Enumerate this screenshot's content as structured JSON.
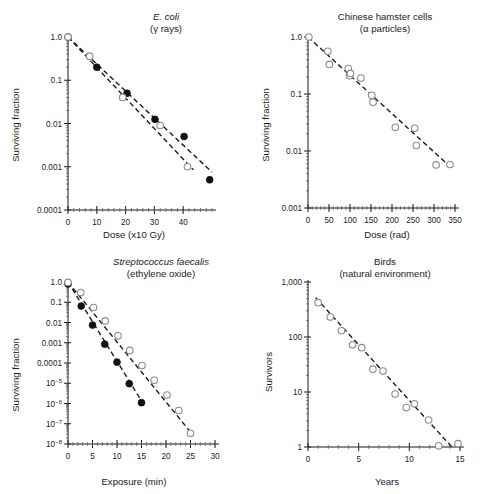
{
  "figure": {
    "panel_count": 4
  },
  "chart_data": [
    {
      "id": "ecoli",
      "type": "scatter",
      "title": "E. coli",
      "title_line1": "E. coli",
      "title_line2": "(γ rays)",
      "xlabel": "Dose (x10 Gy)",
      "ylabel": "Surviving fraction",
      "yscale": "log",
      "xlim": [
        0,
        50
      ],
      "ylim": [
        0.0001,
        1.0
      ],
      "xticks": [
        0,
        10,
        20,
        30,
        40
      ],
      "xticklabels": [
        "0",
        "10",
        "20",
        "30",
        "40"
      ],
      "yticks": [
        1.0,
        0.1,
        0.01,
        0.001,
        0.0001
      ],
      "yticklabels": [
        "1.0",
        "0.1",
        "0.01",
        "0.001",
        "0.0001"
      ],
      "grid": false,
      "legend": "none",
      "series": [
        {
          "name": "filled",
          "marker": "filled-circle",
          "x": [
            0,
            10,
            20.5,
            30.2,
            40.3,
            49.2
          ],
          "y": [
            1.0,
            0.2,
            0.05,
            0.0125,
            0.005,
            0.0005
          ]
        },
        {
          "name": "open",
          "marker": "open-circle",
          "x": [
            0,
            7.5,
            19.0,
            32.0,
            41.5
          ],
          "y": [
            1.0,
            0.36,
            0.04,
            0.009,
            0.001
          ]
        }
      ],
      "trendlines": [
        {
          "name": "fit-filled",
          "x": [
            0,
            50
          ],
          "y": [
            1.0,
            0.00075
          ]
        },
        {
          "name": "fit-open",
          "x": [
            0,
            43.5
          ],
          "y": [
            1.0,
            0.00085
          ]
        }
      ]
    },
    {
      "id": "hamster",
      "type": "scatter",
      "title": "Chinese hamster cells",
      "title_line1": "Chinese hamster cells",
      "title_line2": "(α particles)",
      "xlabel": "Dose (rad)",
      "ylabel": "Surviving fraction",
      "yscale": "log",
      "xlim": [
        0,
        350
      ],
      "ylim": [
        0.001,
        1.0
      ],
      "xticks": [
        0,
        50,
        100,
        150,
        200,
        250,
        300,
        350
      ],
      "xticklabels": [
        "0",
        "50",
        "100",
        "150",
        "200",
        "250",
        "300",
        "350"
      ],
      "yticks": [
        1.0,
        0.1,
        0.01,
        0.001
      ],
      "yticklabels": [
        "1.0",
        "0.1",
        "0.01",
        "0.001"
      ],
      "grid": false,
      "legend": "none",
      "series": [
        {
          "name": "open",
          "marker": "open-circle",
          "x": [
            2,
            47,
            51,
            96,
            99,
            101,
            126,
            152,
            155,
            208,
            254,
            258,
            305,
            338
          ],
          "y": [
            1.0,
            0.56,
            0.33,
            0.28,
            0.21,
            0.23,
            0.19,
            0.095,
            0.072,
            0.026,
            0.025,
            0.0125,
            0.0057,
            0.0058
          ]
        }
      ],
      "trendlines": [
        {
          "name": "fit",
          "x": [
            0,
            345
          ],
          "y": [
            1.0,
            0.0048
          ]
        }
      ]
    },
    {
      "id": "strep",
      "type": "scatter",
      "title": "Streptococcus faecalis",
      "title_line1": "Streptococcus faecalis",
      "title_line2": "(ethylene oxide)",
      "xlabel": "Exposure (min)",
      "ylabel": "Surviving fraction",
      "yscale": "log",
      "xlim": [
        0,
        30
      ],
      "ylim": [
        1e-08,
        1.0
      ],
      "xticks": [
        0,
        5,
        10,
        15,
        20,
        25,
        30
      ],
      "xticklabels": [
        "0",
        "5",
        "10",
        "15",
        "20",
        "25",
        "30"
      ],
      "yticks": [
        1.0,
        0.1,
        0.01,
        0.001,
        0.0001,
        1e-05,
        1e-06,
        1e-07,
        1e-08
      ],
      "yticklabels": [
        "1.0",
        "0.1",
        "0.01",
        "0.001",
        "0.0001",
        "10-5",
        "10-6",
        "10-7",
        "10-8"
      ],
      "grid": false,
      "legend": "none",
      "series": [
        {
          "name": "filled",
          "marker": "filled-circle",
          "x": [
            0,
            2.7,
            5.0,
            7.5,
            10.0,
            12.5,
            15.0
          ],
          "y": [
            0.8,
            0.065,
            0.0075,
            0.00085,
            0.00011,
            9.5e-06,
            1.1e-06
          ]
        },
        {
          "name": "open",
          "marker": "open-circle",
          "x": [
            0,
            2.6,
            5.2,
            7.6,
            10.2,
            12.6,
            15.1,
            17.6,
            20.2,
            22.6,
            25.0
          ],
          "y": [
            0.95,
            0.3,
            0.055,
            0.012,
            0.0022,
            0.00042,
            7.5e-05,
            1.4e-05,
            2.6e-06,
            4.5e-07,
            3.4e-08
          ]
        }
      ],
      "trendlines": [
        {
          "name": "fit-filled",
          "x": [
            0,
            15.8
          ],
          "y": [
            1.0,
            6.5e-07
          ]
        },
        {
          "name": "fit-open",
          "x": [
            0,
            25.6
          ],
          "y": [
            1.0,
            2.6e-08
          ]
        }
      ]
    },
    {
      "id": "birds",
      "type": "scatter",
      "title": "Birds",
      "title_line1": "Birds",
      "title_line2": "(natural environment)",
      "xlabel": "Years",
      "ylabel": "Survivors",
      "yscale": "log",
      "xlim": [
        0,
        15
      ],
      "ylim": [
        1,
        1000
      ],
      "xticks": [
        0,
        5,
        10,
        15
      ],
      "xticklabels": [
        "0",
        "5",
        "10",
        "15"
      ],
      "yticks": [
        1000,
        100,
        10,
        1
      ],
      "yticklabels": [
        "1,000",
        "100",
        "10",
        "1"
      ],
      "grid": false,
      "legend": "none",
      "series": [
        {
          "name": "open",
          "marker": "open-circle",
          "x": [
            1.0,
            2.2,
            3.3,
            4.4,
            5.3,
            6.4,
            7.4,
            8.6,
            9.7,
            10.5,
            11.9,
            12.9,
            14.8
          ],
          "y": [
            420,
            230,
            130,
            72,
            64,
            26,
            24,
            9.2,
            5.2,
            6.1,
            3.1,
            1.05,
            1.15
          ]
        }
      ],
      "trendlines": [
        {
          "name": "fit",
          "x": [
            0.75,
            14.2
          ],
          "y": [
            520,
            1.0
          ]
        }
      ]
    }
  ]
}
